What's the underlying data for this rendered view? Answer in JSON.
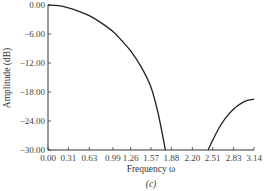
{
  "chart_data": {
    "type": "line",
    "title": "",
    "caption": "(c)",
    "xlabel": "Frequency ω",
    "ylabel": "Amplitude (dB)",
    "xlim": [
      0,
      3.14
    ],
    "ylim": [
      -30,
      0
    ],
    "grid": false,
    "x_ticks": [
      "0.00",
      "0.31",
      "0.63",
      "0.99",
      "1.26",
      "1.57",
      "1.88",
      "2.20",
      "2.51",
      "2.83",
      "3.14"
    ],
    "x_tick_values": [
      0.0,
      0.31,
      0.63,
      0.99,
      1.26,
      1.57,
      1.88,
      2.2,
      2.51,
      2.83,
      3.14
    ],
    "y_ticks": [
      "0.00",
      "-6.00",
      "-12.00",
      "-18.00",
      "-24.00",
      "-30.00"
    ],
    "y_tick_values": [
      0,
      -6,
      -12,
      -18,
      -24,
      -30
    ],
    "series": [
      {
        "name": "main lobe",
        "x": [
          0.0,
          0.16,
          0.31,
          0.47,
          0.63,
          0.8,
          0.99,
          1.12,
          1.26,
          1.42,
          1.57,
          1.68,
          1.79
        ],
        "values": [
          0.0,
          -0.15,
          -0.6,
          -1.3,
          -2.2,
          -3.6,
          -5.5,
          -7.3,
          -9.5,
          -12.8,
          -17.0,
          -22.5,
          -30.0
        ]
      },
      {
        "name": "side lobe",
        "x": [
          2.44,
          2.51,
          2.6,
          2.7,
          2.83,
          2.95,
          3.05,
          3.14
        ],
        "values": [
          -30.0,
          -28.0,
          -25.6,
          -23.5,
          -21.5,
          -20.3,
          -19.7,
          -19.5
        ]
      }
    ]
  }
}
